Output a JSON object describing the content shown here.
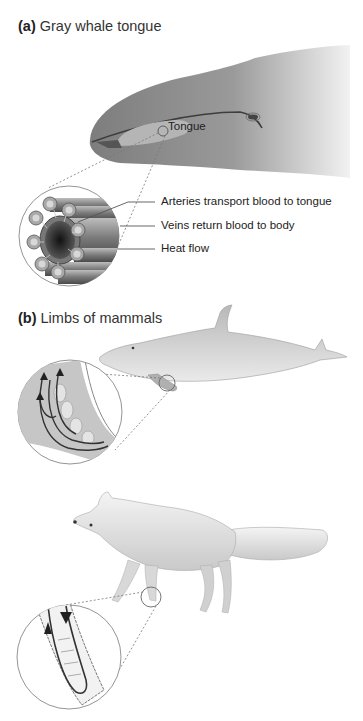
{
  "panel_a": {
    "letter": "(a)",
    "title": "Gray whale tongue",
    "labels": {
      "tongue": "Tongue",
      "arteries": "Arteries transport blood to tongue",
      "veins": "Veins return blood to body",
      "heat_flow": "Heat flow"
    }
  },
  "panel_b": {
    "letter": "(b)",
    "title": "Limbs of mammals",
    "animals": [
      "dolphin",
      "arctic fox"
    ]
  },
  "colors": {
    "whale_gray": "#8a8a8a",
    "vessel_dark": "#3a3a3a",
    "fur_light": "#eeeeee",
    "callout_line": "#777777"
  }
}
